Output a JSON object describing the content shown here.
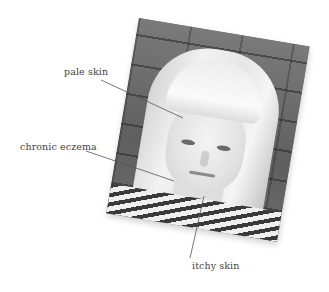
{
  "figure": {
    "photo_alt": "Black-and-white portrait of a woman with long blonde hair and fringe in front of a brick wall",
    "labels": [
      {
        "text": "pale skin"
      },
      {
        "text": "chronic eczema"
      },
      {
        "text": "itchy skin"
      }
    ],
    "colors": {
      "label_text": "#444444",
      "leader_line": "#555555",
      "background": "#ffffff"
    }
  }
}
